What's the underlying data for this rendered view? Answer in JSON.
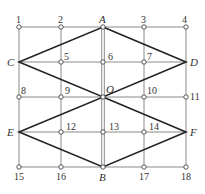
{
  "diagram": {
    "type": "grid-with-rhombi",
    "colors": {
      "grid": "#8a8a8a",
      "rhombus": "#222222",
      "node_fill": "#ffffff",
      "label": "#333333"
    },
    "columns_x": [
      19,
      61,
      103,
      144,
      186
    ],
    "rows_y": [
      27,
      62,
      97,
      132,
      167
    ],
    "points": [
      {
        "label": "1",
        "x": 19,
        "y": 27,
        "italic": false,
        "lx": 16,
        "ly": 23
      },
      {
        "label": "2",
        "x": 61,
        "y": 27,
        "italic": false,
        "lx": 58,
        "ly": 23
      },
      {
        "label": "A",
        "x": 103,
        "y": 27,
        "italic": true,
        "lx": 99,
        "ly": 23
      },
      {
        "label": "3",
        "x": 144,
        "y": 27,
        "italic": false,
        "lx": 141,
        "ly": 23
      },
      {
        "label": "4",
        "x": 186,
        "y": 27,
        "italic": false,
        "lx": 182,
        "ly": 23
      },
      {
        "label": "C",
        "x": 19,
        "y": 62,
        "italic": true,
        "lx": 7,
        "ly": 66
      },
      {
        "label": "5",
        "x": 61,
        "y": 62,
        "italic": false,
        "lx": 64,
        "ly": 60
      },
      {
        "label": "6",
        "x": 103,
        "y": 62,
        "italic": false,
        "lx": 108,
        "ly": 60
      },
      {
        "label": "7",
        "x": 144,
        "y": 62,
        "italic": false,
        "lx": 147,
        "ly": 60
      },
      {
        "label": "D",
        "x": 186,
        "y": 62,
        "italic": true,
        "lx": 190,
        "ly": 66
      },
      {
        "label": "8",
        "x": 19,
        "y": 97,
        "italic": false,
        "lx": 21,
        "ly": 94
      },
      {
        "label": "9",
        "x": 61,
        "y": 97,
        "italic": false,
        "lx": 65,
        "ly": 94
      },
      {
        "label": "O",
        "x": 103,
        "y": 97,
        "italic": true,
        "lx": 106,
        "ly": 93
      },
      {
        "label": "10",
        "x": 144,
        "y": 97,
        "italic": false,
        "lx": 147,
        "ly": 94
      },
      {
        "label": "11",
        "x": 186,
        "y": 97,
        "italic": false,
        "lx": 190,
        "ly": 100
      },
      {
        "label": "E",
        "x": 19,
        "y": 132,
        "italic": true,
        "lx": 7,
        "ly": 136
      },
      {
        "label": "12",
        "x": 61,
        "y": 132,
        "italic": false,
        "lx": 66,
        "ly": 130
      },
      {
        "label": "13",
        "x": 103,
        "y": 132,
        "italic": false,
        "lx": 109,
        "ly": 130
      },
      {
        "label": "14",
        "x": 144,
        "y": 132,
        "italic": false,
        "lx": 149,
        "ly": 130
      },
      {
        "label": "F",
        "x": 186,
        "y": 132,
        "italic": true,
        "lx": 190,
        "ly": 136
      },
      {
        "label": "15",
        "x": 19,
        "y": 167,
        "italic": false,
        "lx": 14,
        "ly": 180
      },
      {
        "label": "16",
        "x": 61,
        "y": 167,
        "italic": false,
        "lx": 56,
        "ly": 180
      },
      {
        "label": "B",
        "x": 103,
        "y": 167,
        "italic": true,
        "lx": 99,
        "ly": 181
      },
      {
        "label": "17",
        "x": 144,
        "y": 167,
        "italic": false,
        "lx": 139,
        "ly": 180
      },
      {
        "label": "18",
        "x": 186,
        "y": 167,
        "italic": false,
        "lx": 181,
        "ly": 180
      }
    ],
    "rhombi": [
      {
        "name": "upper",
        "vertices": [
          "A",
          "D",
          "O",
          "C"
        ]
      },
      {
        "name": "lower",
        "vertices": [
          "O",
          "F",
          "B",
          "E"
        ]
      }
    ]
  }
}
